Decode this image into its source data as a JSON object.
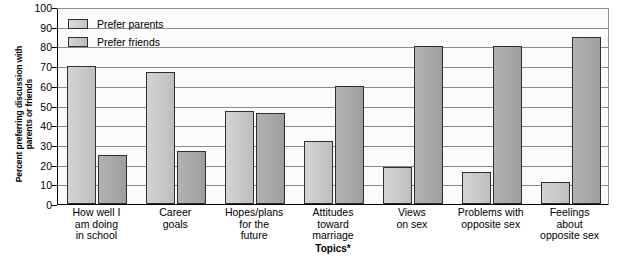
{
  "chart_data": {
    "type": "bar",
    "title": "",
    "xlabel": "Topics*",
    "ylabel": "Percent preferring discussion with\nparents or friends",
    "ylim": [
      0,
      100
    ],
    "ytick_labels": [
      "100",
      "90",
      "80",
      "70",
      "60",
      "50",
      "40",
      "30",
      "20",
      "10",
      "0"
    ],
    "ytick_values": [
      100,
      90,
      80,
      70,
      60,
      50,
      40,
      30,
      20,
      10,
      0
    ],
    "grid": true,
    "legend_position": "top-left",
    "categories": [
      "How well I\nam doing\nin school",
      "Career\ngoals",
      "Hopes/plans\nfor the\nfuture",
      "Attitudes\ntoward\nmarriage",
      "Views\non sex",
      "Problems with\nopposite sex",
      "Feelings\nabout\nopposite sex"
    ],
    "series": [
      {
        "name": "Prefer parents",
        "color": "#c9c9c9",
        "values": [
          70,
          67,
          47,
          32,
          19,
          16,
          11
        ]
      },
      {
        "name": "Prefer friends",
        "color": "#a8a8a8",
        "values": [
          25,
          27,
          46,
          60,
          80,
          80,
          85
        ]
      }
    ]
  }
}
